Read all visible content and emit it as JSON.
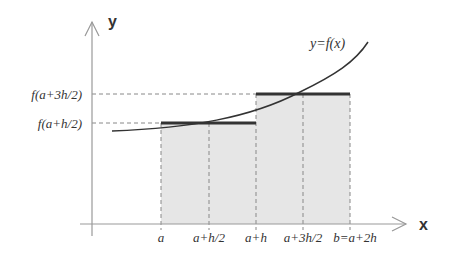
{
  "diagram": {
    "axes": {
      "x_label": "x",
      "y_label": "y"
    },
    "curve_label": "y=f(x)",
    "x_ticks": [
      "a",
      "a+h/2",
      "a+h",
      "a+3h/2",
      "b=a+2h"
    ],
    "y_ticks": [
      "f(a+3h/2)",
      "f(a+h/2)"
    ],
    "colors": {
      "rect_fill": "#e6e6e6",
      "axis": "#999999",
      "curve": "#333333",
      "bar": "#333333",
      "dashed": "#888888"
    }
  }
}
